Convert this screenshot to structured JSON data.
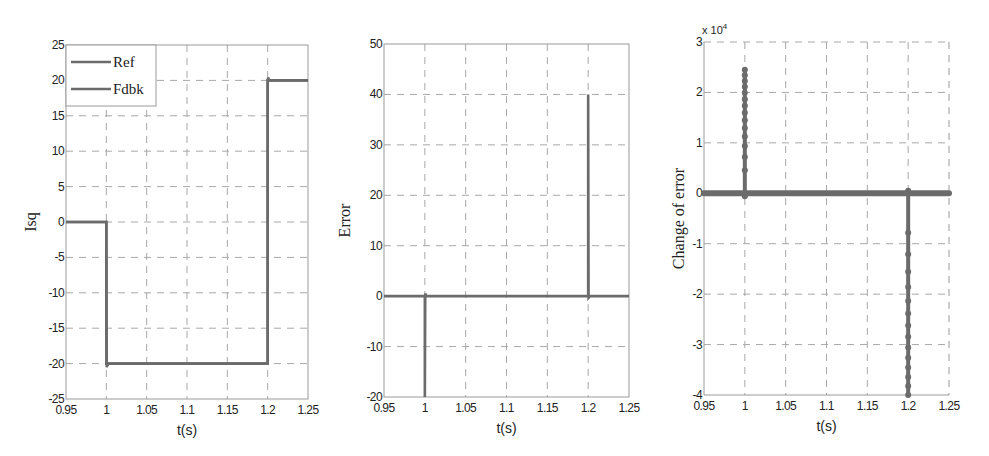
{
  "style": {
    "line_color": "#6b6b6b",
    "axis_color": "#9a9a9a",
    "grid_color": "#a8a8a8",
    "text_color": "#222222"
  },
  "chart_data": [
    {
      "type": "line",
      "title": "",
      "xlabel": "t(s)",
      "ylabel": "Isq",
      "xlim": [
        0.95,
        1.25
      ],
      "ylim": [
        -25,
        25
      ],
      "xticks": [
        0.95,
        1,
        1.05,
        1.1,
        1.15,
        1.2,
        1.25
      ],
      "xtick_labels": [
        "0.95",
        "1",
        "1.05",
        "1.1",
        "1.15",
        "1.2",
        "1.25"
      ],
      "yticks": [
        -25,
        -20,
        -15,
        -10,
        -5,
        0,
        5,
        10,
        15,
        20,
        25
      ],
      "ytick_labels": [
        "-25",
        "-20",
        "-15",
        "-10",
        "-5",
        "0",
        "5",
        "10",
        "15",
        "20",
        "25"
      ],
      "grid": true,
      "legend": {
        "position": "upper left",
        "entries": [
          "Ref",
          "Fdbk"
        ]
      },
      "series": [
        {
          "name": "Ref",
          "x": [
            0.95,
            1.0,
            1.0,
            1.2,
            1.2,
            1.25
          ],
          "y": [
            0,
            0,
            -20,
            -20,
            20,
            20
          ]
        },
        {
          "name": "Fdbk",
          "x": [
            0.95,
            1.0,
            1.0005,
            1.001,
            1.003,
            1.2,
            1.2,
            1.2005,
            1.202,
            1.25
          ],
          "y": [
            0,
            0,
            -20.5,
            -20.3,
            -20,
            -20,
            19.5,
            20.4,
            20,
            20
          ]
        }
      ]
    },
    {
      "type": "line",
      "title": "",
      "xlabel": "t(s)",
      "ylabel": "Error",
      "xlim": [
        0.95,
        1.25
      ],
      "ylim": [
        -20,
        50
      ],
      "xticks": [
        0.95,
        1,
        1.05,
        1.1,
        1.15,
        1.2,
        1.25
      ],
      "xtick_labels": [
        "0.95",
        "1",
        "1.05",
        "1.1",
        "1.15",
        "1.2",
        "1.25"
      ],
      "yticks": [
        -20,
        -10,
        0,
        10,
        20,
        30,
        40,
        50
      ],
      "ytick_labels": [
        "-20",
        "-10",
        "0",
        "10",
        "20",
        "30",
        "40",
        "50"
      ],
      "grid": true,
      "series": [
        {
          "name": "Error",
          "x": [
            0.95,
            1.0,
            1.0,
            1.0005,
            1.002,
            1.2,
            1.2,
            1.2005,
            1.202,
            1.25
          ],
          "y": [
            0,
            0,
            -20,
            0.5,
            0,
            0,
            40,
            -0.3,
            0,
            0
          ]
        }
      ]
    },
    {
      "type": "scatter",
      "title": "",
      "xlabel": "t(s)",
      "ylabel": "Change of error",
      "y_multiplier_label": "x 10^4",
      "xlim": [
        0.95,
        1.25
      ],
      "ylim": [
        -40000,
        30000
      ],
      "xticks": [
        0.95,
        1,
        1.05,
        1.1,
        1.15,
        1.2,
        1.25
      ],
      "xtick_labels": [
        "0.95",
        "1",
        "1.05",
        "1.1",
        "1.15",
        "1.2",
        "1.25"
      ],
      "yticks": [
        -40000,
        -30000,
        -20000,
        -10000,
        0,
        10000,
        20000,
        30000
      ],
      "ytick_labels": [
        "-4",
        "-3",
        "-2",
        "-1",
        "0",
        "1",
        "2",
        "3"
      ],
      "grid": true,
      "series": [
        {
          "name": "Change of error",
          "baseline": {
            "x_start": 0.95,
            "x_end": 1.25,
            "y": 0
          },
          "spikes": [
            {
              "x": 1.0,
              "y_from": -600,
              "y_to": 24500
            },
            {
              "x": 1.2,
              "y_from": 500,
              "y_to": -40000
            }
          ]
        }
      ]
    }
  ]
}
